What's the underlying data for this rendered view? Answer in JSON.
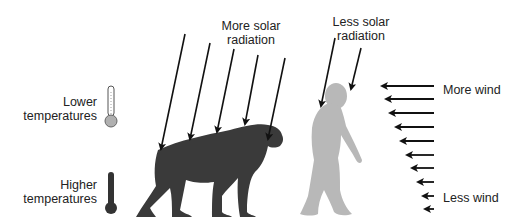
{
  "labels": {
    "more_solar_line1": "More solar",
    "more_solar_line2": "radiation",
    "less_solar_line1": "Less solar",
    "less_solar_line2": "radiation",
    "lower_temp_line1": "Lower",
    "lower_temp_line2": "temperatures",
    "higher_temp_line1": "Higher",
    "higher_temp_line2": "temperatures",
    "more_wind": "More wind",
    "less_wind": "Less wind"
  },
  "figures": {
    "quadruped_ape": {
      "color": "#3a3a3a",
      "description": "knuckle-walking ape silhouette"
    },
    "bipedal_hominin": {
      "color": "#b5b5b5",
      "description": "upright walking hominin silhouette"
    }
  },
  "colors": {
    "arrow": "#111111",
    "thermometer_cool_bulb": "#b0b0b0",
    "thermometer_hot": "#333333"
  },
  "arrows": {
    "solar_on_ape": 5,
    "solar_on_hominin": 2,
    "wind": 10
  }
}
